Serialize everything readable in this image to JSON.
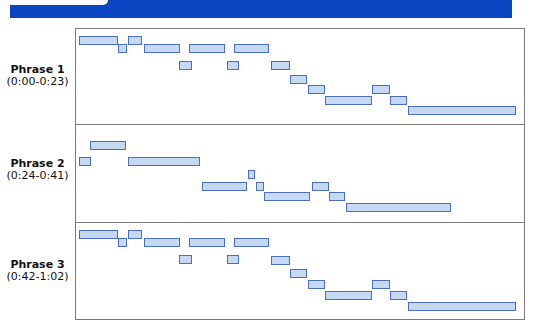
{
  "header": {
    "band_color": "#0a45c2"
  },
  "colors": {
    "note_fill": "#c6d9f3",
    "note_border": "#4a6fc1",
    "frame_border": "#7a7a7a"
  },
  "phrases": [
    {
      "title": "Phrase 1",
      "range": "(0:00-0:23)",
      "label_top": 64,
      "notes": [
        {
          "x": 79,
          "y": 36,
          "w": 39
        },
        {
          "x": 118,
          "y": 44,
          "w": 9
        },
        {
          "x": 128,
          "y": 36,
          "w": 14
        },
        {
          "x": 144,
          "y": 44,
          "w": 36
        },
        {
          "x": 179,
          "y": 61,
          "w": 13
        },
        {
          "x": 189,
          "y": 44,
          "w": 36
        },
        {
          "x": 227,
          "y": 61,
          "w": 12
        },
        {
          "x": 234,
          "y": 44,
          "w": 35
        },
        {
          "x": 271,
          "y": 61,
          "w": 19
        },
        {
          "x": 290,
          "y": 75,
          "w": 17
        },
        {
          "x": 308,
          "y": 85,
          "w": 17
        },
        {
          "x": 325,
          "y": 96,
          "w": 47
        },
        {
          "x": 372,
          "y": 85,
          "w": 18
        },
        {
          "x": 390,
          "y": 96,
          "w": 17
        },
        {
          "x": 408,
          "y": 106,
          "w": 108
        }
      ]
    },
    {
      "title": "Phrase 2",
      "range": "(0:24-0:41)",
      "label_top": 158,
      "notes": [
        {
          "x": 90,
          "y": 141,
          "w": 36
        },
        {
          "x": 79,
          "y": 157,
          "w": 12
        },
        {
          "x": 128,
          "y": 157,
          "w": 72
        },
        {
          "x": 202,
          "y": 182,
          "w": 45
        },
        {
          "x": 248,
          "y": 170,
          "w": 7
        },
        {
          "x": 256,
          "y": 182,
          "w": 8
        },
        {
          "x": 264,
          "y": 192,
          "w": 46
        },
        {
          "x": 312,
          "y": 182,
          "w": 17
        },
        {
          "x": 329,
          "y": 192,
          "w": 16
        },
        {
          "x": 346,
          "y": 203,
          "w": 105
        }
      ]
    },
    {
      "title": "Phrase 3",
      "range": "(0:42-1:02)",
      "label_top": 259,
      "notes": [
        {
          "x": 79,
          "y": 230,
          "w": 39
        },
        {
          "x": 118,
          "y": 238,
          "w": 9
        },
        {
          "x": 128,
          "y": 230,
          "w": 14
        },
        {
          "x": 144,
          "y": 238,
          "w": 36
        },
        {
          "x": 179,
          "y": 255,
          "w": 13
        },
        {
          "x": 189,
          "y": 238,
          "w": 36
        },
        {
          "x": 227,
          "y": 255,
          "w": 12
        },
        {
          "x": 234,
          "y": 238,
          "w": 35
        },
        {
          "x": 271,
          "y": 256,
          "w": 19
        },
        {
          "x": 290,
          "y": 269,
          "w": 17
        },
        {
          "x": 308,
          "y": 280,
          "w": 17
        },
        {
          "x": 325,
          "y": 291,
          "w": 47
        },
        {
          "x": 372,
          "y": 280,
          "w": 18
        },
        {
          "x": 390,
          "y": 291,
          "w": 17
        },
        {
          "x": 408,
          "y": 302,
          "w": 108
        }
      ]
    }
  ],
  "dividers": [
    124,
    222
  ]
}
